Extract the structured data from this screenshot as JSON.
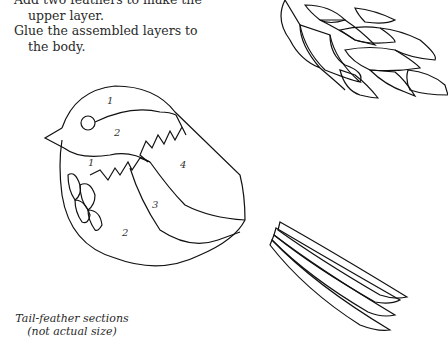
{
  "instructions": {
    "lines": [
      "Add two feathers to make the upper layer.",
      "Glue the assembled layers to the body."
    ]
  },
  "diagram": {
    "section_labels": [
      {
        "id": "head-1",
        "text": "1"
      },
      {
        "id": "cap-2",
        "text": "2"
      },
      {
        "id": "neck-1",
        "text": "1"
      },
      {
        "id": "back-4",
        "text": "4"
      },
      {
        "id": "wing-3",
        "text": "3"
      },
      {
        "id": "belly-2",
        "text": "2"
      }
    ]
  },
  "caption": {
    "line1": "Tail-feather sections",
    "line2": "(not actual size)"
  }
}
